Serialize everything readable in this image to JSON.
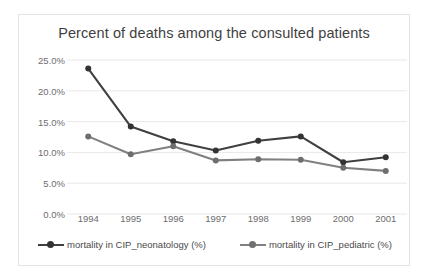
{
  "chart_data": {
    "type": "line",
    "title": "Percent of deaths among the consulted patients",
    "xlabel": "",
    "ylabel": "",
    "categories": [
      "1994",
      "1995",
      "1996",
      "1997",
      "1998",
      "1999",
      "2000",
      "2001"
    ],
    "ylim": [
      0,
      25
    ],
    "ytick_labels": [
      "25.0%",
      "20.0%",
      "15.0%",
      "10.0%",
      "5.0%",
      "0.0%"
    ],
    "ytick_values": [
      25,
      20,
      15,
      10,
      5,
      0
    ],
    "grid": true,
    "legend_position": "bottom",
    "series": [
      {
        "name": "mortality in CIP_neonatology (%)",
        "color": "#404040",
        "values": [
          23.6,
          14.2,
          11.8,
          10.3,
          11.9,
          12.6,
          8.4,
          9.2
        ]
      },
      {
        "name": "mortality in CIP_pediatric (%)",
        "color": "#808080",
        "values": [
          12.6,
          9.7,
          11.0,
          8.7,
          8.9,
          8.8,
          7.5,
          7.0
        ]
      }
    ]
  },
  "colors": {
    "series_neonatology": "#404040",
    "series_pediatric": "#808080",
    "gridline": "#e8e8e8",
    "axis_text": "#6d6d6d",
    "title_text": "#3f3f3f",
    "frame_border": "#e3e3e3",
    "background": "#ffffff"
  }
}
